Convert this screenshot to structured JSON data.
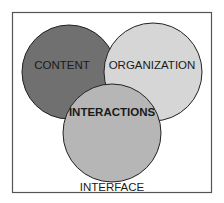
{
  "diagram": {
    "type": "venn",
    "frame": {
      "x": 12,
      "y": 12,
      "width": 200,
      "height": 181,
      "stroke": "#555555"
    },
    "circles": [
      {
        "id": "content",
        "label": "CONTENT",
        "cx": 69,
        "cy": 72,
        "r": 47,
        "fill": "#707070",
        "bold": false
      },
      {
        "id": "organization",
        "label": "ORGANIZATION",
        "cx": 153,
        "cy": 72,
        "r": 49,
        "fill": "#d6d6d6",
        "bold": false
      },
      {
        "id": "interactions",
        "label": "INTERACTIONS",
        "cx": 112,
        "cy": 133,
        "r": 49,
        "fill": "#b6b6b6",
        "bold": true
      }
    ],
    "outer_label": "INTERFACE"
  }
}
